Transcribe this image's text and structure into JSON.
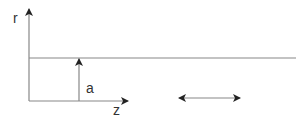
{
  "diagram": {
    "type": "cylinder-geometry",
    "labels": {
      "r_axis": "r",
      "z_axis": "z",
      "radius": "a"
    },
    "colors": {
      "line": "#888888",
      "arrow": "#222222",
      "text": "#333333",
      "background": "#ffffff"
    },
    "elements": [
      {
        "name": "r-axis",
        "description": "vertical axis with arrowhead, labeled r"
      },
      {
        "name": "z-axis",
        "description": "horizontal axis with arrowhead, labeled z"
      },
      {
        "name": "boundary-line",
        "description": "horizontal line at r = a extending to the right"
      },
      {
        "name": "radius-arrow",
        "description": "vertical arrow from z-axis to boundary line, labeled a"
      },
      {
        "name": "double-arrow",
        "description": "horizontal double-headed arrow indicating motion along z"
      }
    ]
  }
}
